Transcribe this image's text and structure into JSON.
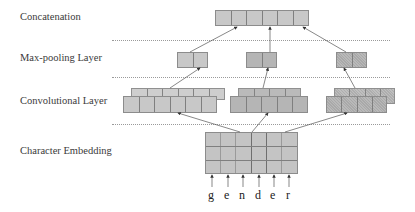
{
  "layers": {
    "concatenation": "Concatenation",
    "max_pooling": "Max-pooling Layer",
    "convolutional": "Convolutional  Layer",
    "embedding": "Character Embedding"
  },
  "input_characters": [
    "g",
    "e",
    "n",
    "d",
    "e",
    "r"
  ],
  "structure": {
    "concatenation_cells": 6,
    "max_pool_groups": 3,
    "max_pool_cells_per_group": 2,
    "conv_groups": [
      {
        "front_cells": 6,
        "back_cells": 6
      },
      {
        "front_cells": 5,
        "back_cells": 4
      },
      {
        "front_cells": 4,
        "back_cells": 4
      }
    ],
    "embedding_grid": {
      "rows": 3,
      "cols": 6
    }
  },
  "colors": {
    "cell_light": "#c8c8c8",
    "cell_mid": "#b5b5b5",
    "cell_border": "#8c8c8c",
    "dotted_line": "#9a9a9a",
    "arrow": "#333333"
  }
}
